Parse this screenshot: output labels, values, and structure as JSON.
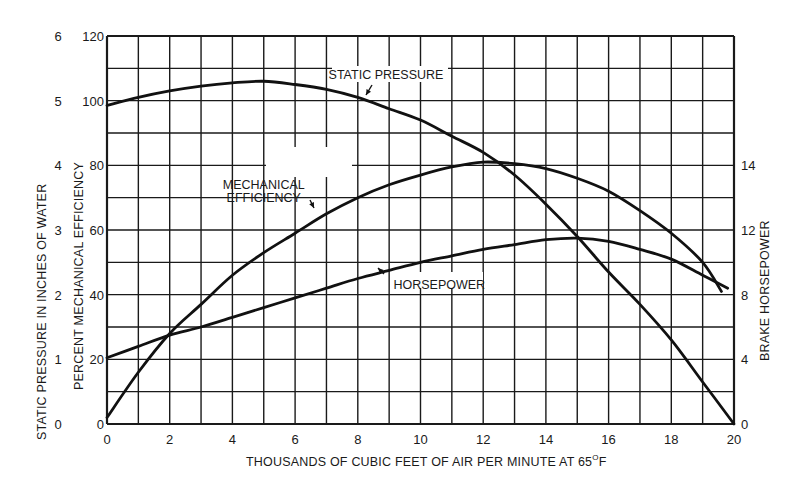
{
  "chart_data": {
    "type": "line",
    "title": "",
    "xlabel": "THOUSANDS OF CUBIC FEET OF AIR PER MINUTE AT 65°F",
    "xlabel_parts": {
      "main": "THOUSANDS OF CUBIC FEET OF AIR PER MINUTE AT 65",
      "sup": "O",
      "end": "F"
    },
    "ylabel_outer": "STATIC PRESSURE IN INCHES OF WATER",
    "ylabel_inner": "PERCENT MECHANICAL EFFICIENCY",
    "ylabel_right": "BRAKE HORSEPOWER",
    "xlim": [
      0,
      20
    ],
    "ylim": [
      0,
      120
    ],
    "grid": true,
    "grid_x_step": 1,
    "grid_y_step": 10,
    "x_ticks": [
      0,
      2,
      4,
      6,
      8,
      10,
      12,
      14,
      16,
      18,
      20
    ],
    "y_ticks_efficiency": [
      0,
      20,
      40,
      60,
      80,
      100,
      120
    ],
    "y_ticks_static_pressure": [
      {
        "label": "0",
        "at": 0
      },
      {
        "label": "1",
        "at": 20
      },
      {
        "label": "2",
        "at": 40
      },
      {
        "label": "3",
        "at": 60
      },
      {
        "label": "4",
        "at": 80
      },
      {
        "label": "5",
        "at": 100
      },
      {
        "label": "6",
        "at": 120
      }
    ],
    "y_ticks_horsepower": [
      {
        "label": "0",
        "at": 0
      },
      {
        "label": "4",
        "at": 20
      },
      {
        "label": "8",
        "at": 40
      },
      {
        "label": "12",
        "at": 60
      },
      {
        "label": "14",
        "at": 80
      }
    ],
    "series": [
      {
        "name": "STATIC PRESSURE",
        "units": "inches of water (plotted on 0-120 scale, 20 units = 1 in)",
        "x": [
          0,
          1,
          2,
          3,
          4,
          5,
          6,
          7,
          8,
          9,
          10,
          11,
          12,
          13,
          14,
          15,
          16,
          17,
          18,
          19,
          20
        ],
        "values_inches": [
          4.93,
          5.05,
          5.15,
          5.23,
          5.28,
          5.3,
          5.25,
          5.17,
          5.05,
          4.88,
          4.7,
          4.45,
          4.2,
          3.85,
          3.4,
          2.9,
          2.35,
          1.85,
          1.3,
          0.65,
          0
        ],
        "plot_values": [
          98.5,
          101,
          103,
          104.5,
          105.5,
          106,
          105,
          103.5,
          101,
          97.5,
          94,
          89,
          84,
          77,
          68,
          58,
          47,
          37,
          26,
          13,
          0
        ]
      },
      {
        "name": "MECHANICAL EFFICIENCY",
        "units": "percent",
        "x": [
          0,
          1,
          2,
          3,
          4,
          5,
          6,
          7,
          8,
          9,
          10,
          11,
          12,
          13,
          14,
          15,
          16,
          17,
          18,
          19,
          19.6
        ],
        "values": [
          2,
          16,
          28,
          37,
          46,
          53,
          59,
          65,
          70,
          74,
          77,
          79.5,
          81,
          80.5,
          79,
          76,
          72,
          66,
          59,
          50,
          41
        ]
      },
      {
        "name": "HORSEPOWER",
        "units": "brake horsepower (plotted on 0-120 scale, 20 units = 4 hp)",
        "x": [
          0,
          1,
          2,
          3,
          4,
          5,
          6,
          7,
          8,
          9,
          10,
          11,
          12,
          13,
          14,
          15,
          16,
          17,
          18,
          19,
          19.8
        ],
        "values_hp": [
          4.1,
          4.8,
          5.5,
          6.0,
          6.6,
          7.2,
          7.8,
          8.4,
          9.0,
          9.5,
          10.0,
          10.4,
          10.8,
          11.1,
          11.4,
          11.5,
          11.3,
          10.8,
          10.2,
          9.2,
          8.4
        ],
        "plot_values": [
          20.5,
          24,
          27.5,
          30,
          33,
          36,
          39,
          42,
          45,
          47.5,
          50,
          52,
          54,
          55.5,
          57,
          57.5,
          56.5,
          54,
          51,
          46,
          42
        ]
      }
    ],
    "annotations": [
      {
        "text": "STATIC PRESSURE",
        "x": 8.9,
        "y": 108
      },
      {
        "text": "MECHANICAL",
        "x": 5.0,
        "y": 74
      },
      {
        "text": "EFFICIENCY",
        "x": 5.0,
        "y": 70
      },
      {
        "text": "HORSEPOWER",
        "x": 10.6,
        "y": 43
      }
    ],
    "legend": "none (inline annotations with arrows)"
  }
}
